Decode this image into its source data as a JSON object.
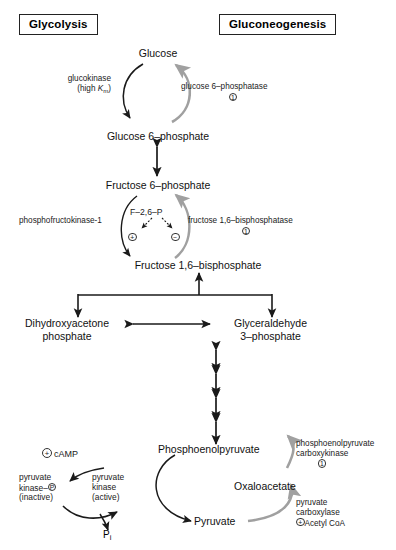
{
  "diagram": {
    "title_left": "Glycolysis",
    "title_right": "Gluconeogenesis",
    "colors": {
      "glycolysis_arrow": "#1a1a1a",
      "gluconeogenesis_arrow": "#a0a0a0",
      "text": "#111111"
    },
    "metabolites": {
      "glucose": "Glucose",
      "glucose_6_phosphate": "Glucose 6–phosphate",
      "fructose_6_phosphate": "Fructose 6–phosphate",
      "fructose_1_6_bisphosphate": "Fructose 1,6–bisphosphate",
      "dhap_line1": "Dihydroxyacetone",
      "dhap_line2": "phosphate",
      "gap_line1": "Glyceraldehyde",
      "gap_line2": "3–phosphate",
      "phosphoenolpyruvate": "Phosphoenolpyruvate",
      "oxaloacetate": "Oxaloacetate",
      "pyruvate": "Pyruvate"
    },
    "enzymes": {
      "glucokinase_line1": "glucokinase",
      "glucokinase_line2_prefix": "(high ",
      "glucokinase_line2_k": "K",
      "glucokinase_line2_sub": "m",
      "glucokinase_line2_suffix": ")",
      "glucose_6_phosphatase": "glucose 6–phosphatase",
      "glucose_6_phosphatase_marker": "1",
      "pfk1": "phosphofructokinase-1",
      "f26p": "F–2,6–P",
      "f26p_activator_sign": "+",
      "f26p_inhibitor_sign": "−",
      "fbpase": "fructose 1,6–bisphosphatase",
      "fbpase_marker": "1",
      "pepck_line1": "phosphoenolpyruvate",
      "pepck_line2": "carboxykinase",
      "pepck_marker": "1",
      "pyruvate_carboxylase_line1": "pyruvate",
      "pyruvate_carboxylase_line2": "carboxylase",
      "pyruvate_carboxylase_effector_sign": "+",
      "pyruvate_carboxylase_effector": "Acetyl CoA",
      "camp_sign": "+",
      "camp_label": "cAMP",
      "pk_inactive_line1": "pyruvate",
      "pk_inactive_line2_prefix": "kinase–",
      "pk_inactive_line2_circle": "P",
      "pk_inactive_line3": "(inactive)",
      "pk_active_line1": "pyruvate",
      "pk_active_line2": "kinase",
      "pk_active_line3": "(active)",
      "pi_symbol": "P",
      "pi_sub": "i"
    }
  }
}
